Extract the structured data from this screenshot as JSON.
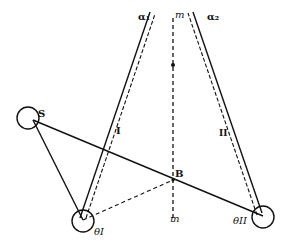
{
  "diagram": {
    "labels": {
      "alpha1": "α₁",
      "alpha2": "α₂",
      "m_top": "m",
      "m_bottom": "m",
      "S": "S",
      "B": "B",
      "line1": "I",
      "line2": "II",
      "theta1": "θI",
      "theta2": "θII"
    },
    "points": {
      "S": [
        33,
        120
      ],
      "thetaI": [
        83,
        220
      ],
      "thetaII": [
        263,
        216
      ],
      "cross": [
        173,
        65
      ],
      "B": [
        173,
        155
      ]
    },
    "colors": {
      "ink": "#111111",
      "background": "#ffffff"
    }
  }
}
